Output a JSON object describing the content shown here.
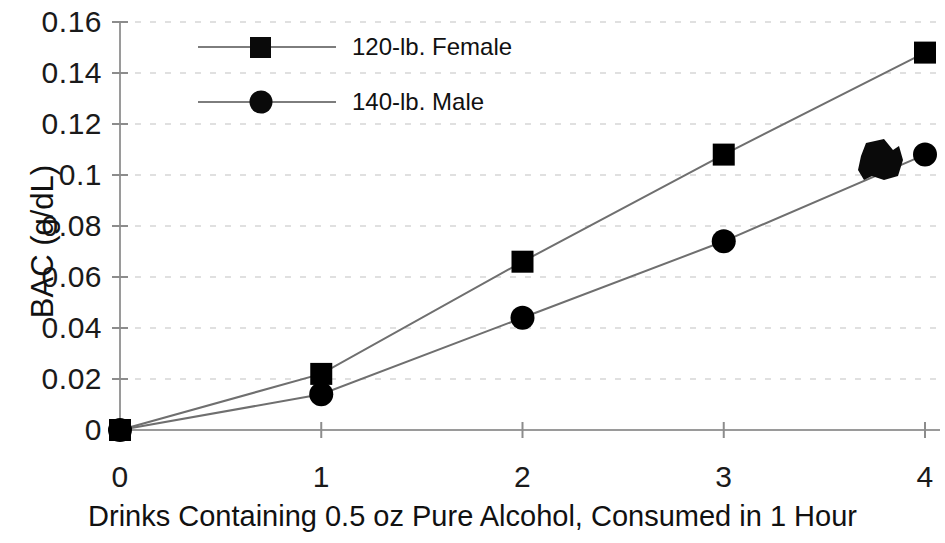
{
  "chart_data": {
    "type": "line",
    "title": "",
    "xlabel": "Drinks Containing 0.5 oz Pure Alcohol, Consumed in 1 Hour",
    "ylabel": "BAC (g/dL)",
    "x": [
      0,
      1,
      2,
      3,
      4
    ],
    "xlim": [
      0,
      4
    ],
    "ylim": [
      0,
      0.16
    ],
    "xticks": [
      "0",
      "1",
      "2",
      "3",
      "4"
    ],
    "yticks": [
      "0",
      "0.02",
      "0.04",
      "0.06",
      "0.08",
      "0.1",
      "0.12",
      "0.14",
      "0.16"
    ],
    "ytick_values": [
      0,
      0.02,
      0.04,
      0.06,
      0.08,
      0.1,
      0.12,
      0.14,
      0.16
    ],
    "grid": "horizontal-dashed",
    "legend_position": "upper-left-inside",
    "series": [
      {
        "name": "120-lb. Female",
        "marker": "square",
        "color": "#000000",
        "values": [
          0,
          0.022,
          0.066,
          0.108,
          0.148
        ]
      },
      {
        "name": "140-lb. Male",
        "marker": "circle",
        "color": "#000000",
        "values": [
          0,
          0.014,
          0.044,
          0.074,
          0.108
        ]
      }
    ],
    "annotations": [
      {
        "name": "scan-ink-blot",
        "description": "irregular dark ink blot artifact over the male series near x=3.75",
        "x": 3.75,
        "y": 0.104
      }
    ]
  },
  "legend": {
    "items": [
      {
        "label": "120-lb. Female",
        "marker": "square"
      },
      {
        "label": "140-lb. Male",
        "marker": "circle"
      }
    ]
  }
}
